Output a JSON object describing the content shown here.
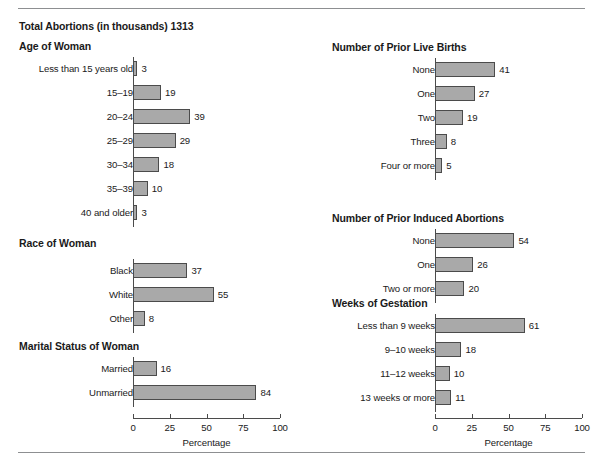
{
  "header": {
    "total_label": "Total Abortions (in thousands) 1313"
  },
  "axis": {
    "title": "Percentage",
    "ticks": [
      "0",
      "25",
      "50",
      "75",
      "100"
    ]
  },
  "sections": {
    "age": {
      "title": "Age of Woman",
      "rows": [
        {
          "label": "Less than 15 years old",
          "value": "3"
        },
        {
          "label": "15–19",
          "value": "19"
        },
        {
          "label": "20–24",
          "value": "39"
        },
        {
          "label": "25–29",
          "value": "29"
        },
        {
          "label": "30–34",
          "value": "18"
        },
        {
          "label": "35–39",
          "value": "10"
        },
        {
          "label": "40 and older",
          "value": "3"
        }
      ]
    },
    "race": {
      "title": "Race of Woman",
      "rows": [
        {
          "label": "Black",
          "value": "37"
        },
        {
          "label": "White",
          "value": "55"
        },
        {
          "label": "Other",
          "value": "8"
        }
      ]
    },
    "marital": {
      "title": "Marital Status of Woman",
      "rows": [
        {
          "label": "Married",
          "value": "16"
        },
        {
          "label": "Unmarried",
          "value": "84"
        }
      ]
    },
    "births": {
      "title": "Number of Prior Live Births",
      "rows": [
        {
          "label": "None",
          "value": "41"
        },
        {
          "label": "One",
          "value": "27"
        },
        {
          "label": "Two",
          "value": "19"
        },
        {
          "label": "Three",
          "value": "8"
        },
        {
          "label": "Four or more",
          "value": "5"
        }
      ]
    },
    "prior_abortions": {
      "title": "Number of Prior Induced Abortions",
      "rows": [
        {
          "label": "None",
          "value": "54"
        },
        {
          "label": "One",
          "value": "26"
        },
        {
          "label": "Two or more",
          "value": "20"
        }
      ]
    },
    "gestation": {
      "title": "Weeks of Gestation",
      "rows": [
        {
          "label": "Less than 9 weeks",
          "value": "61"
        },
        {
          "label": "9–10 weeks",
          "value": "18"
        },
        {
          "label": "11–12 weeks",
          "value": "10"
        },
        {
          "label": "13 weeks or more",
          "value": "11"
        }
      ]
    }
  },
  "chart_data": {
    "type": "bar",
    "title": "Total Abortions (in thousands) 1313",
    "xlabel": "Percentage",
    "ylabel": "",
    "xlim": [
      0,
      100
    ],
    "orientation": "horizontal",
    "grid": false,
    "legend": "none",
    "xticks": [
      0,
      25,
      50,
      75,
      100
    ],
    "panels": [
      {
        "title": "Age of Woman",
        "categories": [
          "Less than 15 years old",
          "15–19",
          "20–24",
          "25–29",
          "30–34",
          "35–39",
          "40 and older"
        ],
        "values": [
          3,
          19,
          39,
          29,
          18,
          10,
          3
        ]
      },
      {
        "title": "Race of Woman",
        "categories": [
          "Black",
          "White",
          "Other"
        ],
        "values": [
          37,
          55,
          8
        ]
      },
      {
        "title": "Marital Status of Woman",
        "categories": [
          "Married",
          "Unmarried"
        ],
        "values": [
          16,
          84
        ]
      },
      {
        "title": "Number of Prior Live Births",
        "categories": [
          "None",
          "One",
          "Two",
          "Three",
          "Four or more"
        ],
        "values": [
          41,
          27,
          19,
          8,
          5
        ]
      },
      {
        "title": "Number of Prior Induced Abortions",
        "categories": [
          "None",
          "One",
          "Two or more"
        ],
        "values": [
          54,
          26,
          20
        ]
      },
      {
        "title": "Weeks of Gestation",
        "categories": [
          "Less than 9 weeks",
          "9–10 weeks",
          "11–12 weeks",
          "13 weeks or more"
        ],
        "values": [
          61,
          18,
          10,
          11
        ]
      }
    ]
  }
}
